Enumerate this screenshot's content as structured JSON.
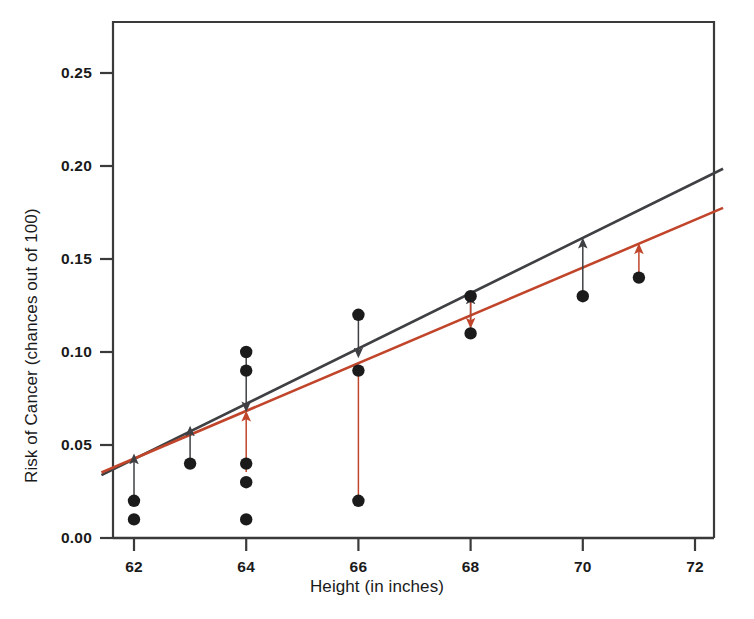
{
  "chart_data": {
    "type": "scatter",
    "title": "",
    "xlabel": "Height (in inches)",
    "ylabel": "Risk of Cancer (chances out of 100)",
    "xlim": [
      61.4,
      72.5
    ],
    "ylim": [
      -0.004,
      0.2775
    ],
    "xticks": [
      62,
      64,
      66,
      68,
      70,
      72
    ],
    "xtick_labels": [
      "62",
      "64",
      "66",
      "68",
      "70",
      "72"
    ],
    "yticks": [
      0.0,
      0.05,
      0.1,
      0.15,
      0.2,
      0.25
    ],
    "ytick_labels": [
      "0.00",
      "0.05",
      "0.10",
      "0.15",
      "0.20",
      "0.25"
    ],
    "grid": false,
    "legend": null,
    "points": [
      {
        "x": 62,
        "y": 0.02
      },
      {
        "x": 62,
        "y": 0.01
      },
      {
        "x": 63,
        "y": 0.04
      },
      {
        "x": 64,
        "y": 0.1
      },
      {
        "x": 64,
        "y": 0.09
      },
      {
        "x": 64,
        "y": 0.04
      },
      {
        "x": 64,
        "y": 0.03
      },
      {
        "x": 64,
        "y": 0.01
      },
      {
        "x": 66,
        "y": 0.12
      },
      {
        "x": 66,
        "y": 0.09
      },
      {
        "x": 66,
        "y": 0.02
      },
      {
        "x": 68,
        "y": 0.13
      },
      {
        "x": 68,
        "y": 0.11
      },
      {
        "x": 70,
        "y": 0.13
      },
      {
        "x": 71,
        "y": 0.14
      }
    ],
    "series": [
      {
        "name": "gray-regression-line",
        "type": "line",
        "color": "#3f4043",
        "x": [
          61.42,
          72.5
        ],
        "y": [
          0.0338,
          0.1985
        ]
      },
      {
        "name": "red-regression-line",
        "type": "line",
        "color": "#c0452a",
        "x": [
          61.42,
          72.5
        ],
        "y": [
          0.0352,
          0.1775
        ]
      }
    ],
    "residual_arrows": [
      {
        "from_x": 62,
        "from_y": 0.021,
        "to_x": 62,
        "to_y": 0.0425,
        "color": "#3f4043"
      },
      {
        "from_x": 63,
        "from_y": 0.042,
        "to_x": 63,
        "to_y": 0.0575,
        "color": "#3f4043"
      },
      {
        "from_x": 64,
        "from_y": 0.099,
        "to_x": 64,
        "to_y": 0.0705,
        "color": "#3f4043"
      },
      {
        "from_x": 66,
        "from_y": 0.119,
        "to_x": 66,
        "to_y": 0.0995,
        "color": "#3f4043"
      },
      {
        "from_x": 68,
        "from_y": 0.1105,
        "to_x": 68,
        "to_y": 0.1285,
        "color": "#3f4043"
      },
      {
        "from_x": 70,
        "from_y": 0.1295,
        "to_x": 70,
        "to_y": 0.1585,
        "color": "#3f4043"
      },
      {
        "from_x": 64,
        "from_y": 0.0355,
        "to_x": 64,
        "to_y": 0.0655,
        "color": "#c0452a"
      },
      {
        "from_x": 66,
        "from_y": 0.0215,
        "to_x": 66,
        "to_y": 0.0905,
        "color": "#c0452a"
      },
      {
        "from_x": 68,
        "from_y": 0.1285,
        "to_x": 68,
        "to_y": 0.1155,
        "color": "#c0452a"
      },
      {
        "from_x": 71,
        "from_y": 0.1385,
        "to_x": 71,
        "to_y": 0.1555,
        "color": "#c0452a"
      }
    ],
    "marker": {
      "shape": "circle",
      "color": "#1b1b1b",
      "radius_px": 6.2
    },
    "axis_color": "#3a3a3a"
  }
}
